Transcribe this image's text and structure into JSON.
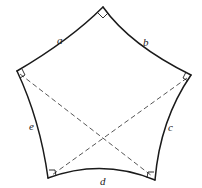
{
  "figure": {
    "colors": {
      "stroke": "#1a1a1a",
      "dashed": "#444444",
      "background": "#ffffff"
    },
    "vertices": [
      {
        "id": "top",
        "x": 103,
        "y": 7
      },
      {
        "id": "right",
        "x": 191,
        "y": 75
      },
      {
        "id": "bottom-right",
        "x": 155,
        "y": 180
      },
      {
        "id": "bottom-left",
        "x": 48,
        "y": 178
      },
      {
        "id": "left",
        "x": 17,
        "y": 71
      }
    ],
    "sides": [
      {
        "label": "a",
        "from": "left",
        "to": "top"
      },
      {
        "label": "b",
        "from": "top",
        "to": "right"
      },
      {
        "label": "c",
        "from": "right",
        "to": "bottom-right"
      },
      {
        "label": "d",
        "from": "bottom-right",
        "to": "bottom-left"
      },
      {
        "label": "e",
        "from": "bottom-left",
        "to": "left"
      }
    ],
    "diagonals": [
      {
        "from": "left",
        "to": "bottom-right",
        "style": "dashed"
      },
      {
        "from": "right",
        "to": "bottom-left",
        "style": "dashed"
      }
    ],
    "right_angle_marks": [
      "top",
      "right",
      "bottom-right",
      "bottom-left",
      "left"
    ],
    "labels": {
      "a": "a",
      "b": "b",
      "c": "c",
      "d": "d",
      "e": "e"
    }
  }
}
